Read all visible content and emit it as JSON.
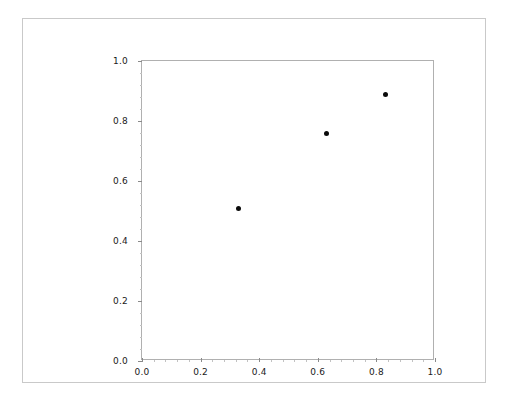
{
  "figure": {
    "background_color": "#ffffff",
    "frame_color": "#c9c9c9",
    "axes_edge_color": "#b0b0b0"
  },
  "chart_data": {
    "type": "scatter",
    "title": "",
    "xlabel": "",
    "ylabel": "",
    "xlim": [
      0.0,
      1.0
    ],
    "ylim": [
      0.0,
      1.0
    ],
    "grid": false,
    "legend": null,
    "marker": {
      "shape": "circle",
      "color": "#0b0b0b",
      "size_px": 5
    },
    "points": [
      {
        "x": 0.33,
        "y": 0.51
      },
      {
        "x": 0.63,
        "y": 0.76
      },
      {
        "x": 0.83,
        "y": 0.89
      }
    ],
    "x_ticks": [
      0.0,
      0.2,
      0.4,
      0.6,
      0.8,
      1.0
    ],
    "y_ticks": [
      0.0,
      0.2,
      0.4,
      0.6,
      0.8,
      1.0
    ],
    "x_tick_labels": [
      "0.0",
      "0.2",
      "0.4",
      "0.6",
      "0.8",
      "1.0"
    ],
    "y_tick_labels": [
      "0.0",
      "0.2",
      "0.4",
      "0.6",
      "0.8",
      "1.0"
    ],
    "x_minor_tick_interval": 0.04,
    "y_minor_tick_interval": 0.04
  }
}
